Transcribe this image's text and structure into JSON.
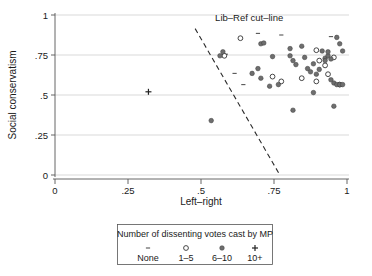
{
  "chart_data": {
    "type": "scatter",
    "title": "",
    "xlabel": "Left–right",
    "ylabel": "Social conservatism",
    "xlim": [
      0,
      1
    ],
    "ylim": [
      0,
      1
    ],
    "xticks": [
      "0",
      ".25",
      ".5",
      ".75",
      "1"
    ],
    "xtick_values": [
      0,
      0.25,
      0.5,
      0.75,
      1
    ],
    "yticks": [
      "0",
      ".25",
      ".5",
      ".75",
      "1"
    ],
    "ytick_values": [
      0,
      0.25,
      0.5,
      0.75,
      1
    ],
    "grid": "horizontal",
    "legend_position": "below-axes",
    "annotations": [
      {
        "text": "Lib–Ref cut–line",
        "x": 0.665,
        "y": 0.96
      }
    ],
    "reference_lines": [
      {
        "name": "Lib–Ref cut–line",
        "style": "dashed",
        "x0": 0.48,
        "y0": 0.915,
        "x1": 0.77,
        "y1": 0.0
      }
    ],
    "legend": {
      "title": "Number of dissenting votes cast by MP",
      "entries": [
        {
          "marker": "dash",
          "label": "None"
        },
        {
          "marker": "open-circle",
          "label": "1–5"
        },
        {
          "marker": "filled-circle",
          "label": "6–10"
        },
        {
          "marker": "plus",
          "label": "10+"
        }
      ]
    },
    "series": [
      {
        "name": "None",
        "marker": "dash",
        "points": [
          [
            0.585,
            0.755
          ],
          [
            0.615,
            0.635
          ],
          [
            0.695,
            0.885
          ],
          [
            0.775,
            0.875
          ],
          [
            0.945,
            0.865
          ],
          [
            0.645,
            0.565
          ]
        ]
      },
      {
        "name": "1–5",
        "marker": "open-circle",
        "points": [
          [
            0.58,
            0.745
          ],
          [
            0.635,
            0.855
          ],
          [
            0.745,
            0.615
          ],
          [
            0.775,
            0.585
          ],
          [
            0.845,
            0.605
          ],
          [
            0.895,
            0.78
          ],
          [
            0.905,
            0.715
          ],
          [
            0.925,
            0.685
          ],
          [
            0.935,
            0.63
          ],
          [
            0.895,
            0.585
          ],
          [
            0.975,
            0.565
          ],
          [
            0.955,
            0.735
          ]
        ]
      },
      {
        "name": "6–10",
        "marker": "filled-circle",
        "points": [
          [
            0.535,
            0.34
          ],
          [
            0.575,
            0.77
          ],
          [
            0.565,
            0.745
          ],
          [
            0.675,
            0.635
          ],
          [
            0.695,
            0.665
          ],
          [
            0.705,
            0.82
          ],
          [
            0.715,
            0.825
          ],
          [
            0.705,
            0.605
          ],
          [
            0.745,
            0.74
          ],
          [
            0.805,
            0.745
          ],
          [
            0.815,
            0.715
          ],
          [
            0.805,
            0.79
          ],
          [
            0.825,
            0.69
          ],
          [
            0.845,
            0.805
          ],
          [
            0.855,
            0.735
          ],
          [
            0.815,
            0.405
          ],
          [
            0.865,
            0.665
          ],
          [
            0.875,
            0.645
          ],
          [
            0.885,
            0.515
          ],
          [
            0.895,
            0.63
          ],
          [
            0.905,
            0.66
          ],
          [
            0.915,
            0.775
          ],
          [
            0.925,
            0.73
          ],
          [
            0.935,
            0.745
          ],
          [
            0.935,
            0.77
          ],
          [
            0.945,
            0.725
          ],
          [
            0.945,
            0.595
          ],
          [
            0.955,
            0.43
          ],
          [
            0.955,
            0.575
          ],
          [
            0.965,
            0.86
          ],
          [
            0.965,
            0.565
          ],
          [
            0.975,
            0.82
          ],
          [
            0.985,
            0.775
          ],
          [
            0.975,
            0.565
          ],
          [
            0.985,
            0.565
          ],
          [
            0.925,
            0.715
          ],
          [
            0.885,
            0.695
          ],
          [
            0.765,
            0.565
          ],
          [
            0.735,
            0.555
          ]
        ]
      },
      {
        "name": "10+",
        "marker": "plus",
        "points": [
          [
            0.32,
            0.52
          ]
        ]
      }
    ]
  },
  "colors": {
    "filled_marker": "#6e6e6e",
    "open_marker_stroke": "#333333",
    "gridline": "#c8c8c8",
    "axis": "#555555",
    "cutline": "#2b2b2b",
    "background": "#ffffff"
  }
}
